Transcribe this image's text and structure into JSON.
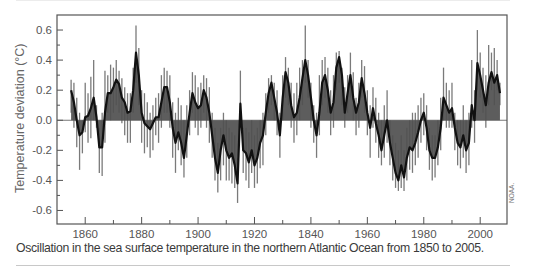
{
  "caption": "Oscillation in the sea surface temperature in the northern Atlantic Ocean from 1850 to 2005.",
  "credit": "NOAA.",
  "colors": {
    "fill": "#4f4f4f",
    "annual_bars": "#7a7a7a",
    "smoothed_line": "#111111",
    "axis": "#555555",
    "zero_line": "#555555"
  },
  "chart_data": {
    "type": "area",
    "title": "",
    "xlabel": "",
    "ylabel": "Temperature deviation (°C)",
    "xlim": [
      1850,
      2009.5
    ],
    "ylim": [
      -0.69,
      0.7
    ],
    "grid": false,
    "legend": "none",
    "x_ticks": [
      {
        "value": 1860,
        "label": "1860"
      },
      {
        "value": 1880,
        "label": "1880"
      },
      {
        "value": 1900,
        "label": "1900"
      },
      {
        "value": 1920,
        "label": "1920"
      },
      {
        "value": 1940,
        "label": "1840"
      },
      {
        "value": 1960,
        "label": "1960"
      },
      {
        "value": 1980,
        "label": "1980"
      },
      {
        "value": 2000,
        "label": "2000"
      }
    ],
    "x_minor_ticks": [
      1870,
      1890,
      1910,
      1930,
      1950,
      1970,
      1990
    ],
    "y_ticks": [
      {
        "value": 0.6,
        "label": "0.6"
      },
      {
        "value": 0.4,
        "label": "0.4"
      },
      {
        "value": 0.2,
        "label": "0.2"
      },
      {
        "value": 0.0,
        "label": "0.0"
      },
      {
        "value": -0.2,
        "label": "-0.2"
      },
      {
        "value": -0.4,
        "label": "-0.4"
      },
      {
        "value": -0.6,
        "label": "-0.6"
      }
    ],
    "y_minor_ticks": [
      0.5,
      0.3,
      0.1,
      -0.1,
      -0.3,
      -0.5
    ],
    "x_start": 1855,
    "series": [
      {
        "name": "Smoothed deviation",
        "values": [
          0.2,
          0.12,
          0.0,
          -0.1,
          -0.08,
          0.02,
          0.03,
          0.08,
          0.15,
          0.02,
          -0.18,
          -0.18,
          0.05,
          0.18,
          0.18,
          0.22,
          0.27,
          0.24,
          0.15,
          0.12,
          0.05,
          0.06,
          0.2,
          0.45,
          0.3,
          0.05,
          -0.02,
          -0.04,
          -0.06,
          -0.02,
          0.02,
          0.02,
          0.12,
          0.22,
          0.22,
          0.12,
          -0.05,
          -0.15,
          -0.08,
          -0.15,
          -0.25,
          -0.1,
          0.05,
          0.18,
          0.12,
          0.08,
          0.1,
          0.2,
          0.15,
          0.05,
          -0.1,
          -0.25,
          -0.35,
          -0.2,
          -0.1,
          -0.2,
          -0.25,
          -0.22,
          -0.3,
          -0.42,
          0.11,
          -0.2,
          -0.22,
          -0.28,
          -0.2,
          -0.3,
          -0.25,
          -0.15,
          -0.1,
          0.05,
          0.18,
          0.25,
          0.15,
          0.05,
          -0.1,
          0.15,
          0.32,
          0.25,
          0.1,
          0.02,
          0.05,
          0.15,
          0.28,
          0.4,
          0.3,
          0.15,
          0.0,
          -0.1,
          0.05,
          0.25,
          0.3,
          0.2,
          0.05,
          0.12,
          0.35,
          0.42,
          0.3,
          0.05,
          0.18,
          0.3,
          0.15,
          0.05,
          0.12,
          0.28,
          0.18,
          0.05,
          -0.05,
          0.08,
          -0.02,
          -0.1,
          -0.2,
          -0.1,
          0.0,
          -0.15,
          -0.25,
          -0.35,
          -0.4,
          -0.3,
          -0.38,
          -0.25,
          -0.18,
          -0.2,
          -0.15,
          -0.08,
          0.0,
          0.05,
          -0.05,
          -0.2,
          -0.25,
          -0.25,
          -0.18,
          -0.05,
          0.15,
          0.1,
          0.05,
          0.08,
          -0.05,
          -0.15,
          -0.18,
          -0.1,
          -0.2,
          -0.15,
          0.1,
          0.0,
          0.38,
          0.3,
          0.2,
          0.1,
          0.25,
          0.32,
          0.25,
          0.3,
          0.18
        ]
      },
      {
        "name": "Annual maximum",
        "values": [
          0.27,
          0.25,
          0.15,
          0.05,
          0.0,
          0.25,
          0.18,
          0.29,
          0.4,
          0.1,
          -0.05,
          0.05,
          0.33,
          0.3,
          0.37,
          0.35,
          0.4,
          0.33,
          0.28,
          0.22,
          0.18,
          0.18,
          0.35,
          0.63,
          0.48,
          0.2,
          0.18,
          0.12,
          0.05,
          0.1,
          0.15,
          0.18,
          0.3,
          0.35,
          0.33,
          0.3,
          0.12,
          0.05,
          0.15,
          0.1,
          0.0,
          0.1,
          0.2,
          0.32,
          0.3,
          0.22,
          0.25,
          0.3,
          0.28,
          0.22,
          0.05,
          -0.05,
          -0.15,
          -0.05,
          0.05,
          0.0,
          -0.05,
          -0.08,
          -0.1,
          -0.25,
          0.33,
          -0.05,
          -0.05,
          -0.08,
          0.0,
          -0.1,
          -0.05,
          0.0,
          0.05,
          0.18,
          0.28,
          0.3,
          0.25,
          0.2,
          0.05,
          0.3,
          0.42,
          0.35,
          0.25,
          0.18,
          0.25,
          0.35,
          0.4,
          0.63,
          0.4,
          0.25,
          0.1,
          0.05,
          0.3,
          0.4,
          0.42,
          0.35,
          0.2,
          0.3,
          0.45,
          0.46,
          0.35,
          0.22,
          0.3,
          0.45,
          0.32,
          0.15,
          0.25,
          0.4,
          0.36,
          0.2,
          0.1,
          0.22,
          0.15,
          0.05,
          0.0,
          0.1,
          0.2,
          0.0,
          -0.1,
          -0.15,
          -0.2,
          -0.1,
          -0.2,
          -0.05,
          0.0,
          0.05,
          0.05,
          0.1,
          0.15,
          0.18,
          0.1,
          -0.05,
          -0.1,
          -0.1,
          0.0,
          0.15,
          0.35,
          0.25,
          0.2,
          0.25,
          0.05,
          0.0,
          0.0,
          0.1,
          0.0,
          0.05,
          0.4,
          0.2,
          0.6,
          0.45,
          0.35,
          0.3,
          0.5,
          0.45,
          0.48,
          0.4,
          0.25
        ]
      },
      {
        "name": "Annual minimum",
        "values": [
          0.05,
          -0.05,
          -0.18,
          -0.33,
          -0.22,
          -0.08,
          -0.15,
          -0.12,
          0.0,
          -0.05,
          -0.35,
          -0.37,
          -0.15,
          0.05,
          0.0,
          0.05,
          0.1,
          0.05,
          -0.02,
          -0.1,
          -0.15,
          -0.15,
          0.05,
          0.25,
          0.1,
          -0.15,
          -0.22,
          -0.18,
          -0.25,
          -0.2,
          -0.1,
          -0.15,
          -0.05,
          0.05,
          0.05,
          -0.05,
          -0.25,
          -0.35,
          -0.2,
          -0.3,
          -0.38,
          -0.25,
          -0.1,
          0.05,
          -0.05,
          -0.1,
          -0.05,
          0.05,
          -0.05,
          -0.15,
          -0.25,
          -0.4,
          -0.48,
          -0.4,
          -0.3,
          -0.4,
          -0.4,
          -0.42,
          -0.45,
          -0.55,
          -0.05,
          -0.35,
          -0.4,
          -0.45,
          -0.35,
          -0.45,
          -0.42,
          -0.32,
          -0.3,
          -0.1,
          0.05,
          0.1,
          0.0,
          -0.1,
          -0.25,
          0.0,
          0.15,
          0.1,
          -0.05,
          -0.15,
          -0.1,
          0.0,
          0.1,
          0.25,
          0.15,
          -0.05,
          -0.15,
          -0.25,
          -0.1,
          0.1,
          0.15,
          0.05,
          -0.1,
          -0.05,
          0.2,
          0.25,
          0.1,
          -0.05,
          0.05,
          0.15,
          0.0,
          -0.1,
          -0.05,
          0.15,
          0.05,
          -0.1,
          -0.25,
          -0.05,
          -0.15,
          -0.25,
          -0.3,
          -0.25,
          -0.15,
          -0.3,
          -0.4,
          -0.45,
          -0.47,
          -0.45,
          -0.47,
          -0.4,
          -0.33,
          -0.35,
          -0.3,
          -0.25,
          -0.15,
          -0.1,
          -0.2,
          -0.33,
          -0.4,
          -0.38,
          -0.3,
          -0.2,
          0.0,
          -0.05,
          -0.05,
          -0.05,
          -0.2,
          -0.3,
          -0.32,
          -0.25,
          -0.35,
          -0.3,
          -0.05,
          -0.15,
          0.2,
          0.15,
          0.05,
          -0.05,
          0.1,
          0.2,
          0.1,
          0.2,
          0.1
        ]
      }
    ]
  }
}
